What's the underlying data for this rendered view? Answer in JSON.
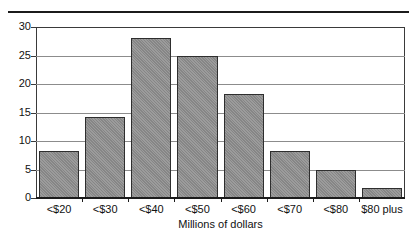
{
  "chart_data": {
    "type": "bar",
    "title": "",
    "subtitle": "",
    "xlabel": "Millions of dollars",
    "ylabel": "",
    "categories": [
      "<$20",
      "<$30",
      "<$40",
      "<$50",
      "<$60",
      "<$70",
      "<$80",
      "$80 plus"
    ],
    "values": [
      8.3,
      14.2,
      28.0,
      25.0,
      18.3,
      8.3,
      5.0,
      1.7
    ],
    "ylim": [
      0,
      30
    ],
    "yticks": [
      0,
      5,
      10,
      15,
      20,
      25,
      30
    ],
    "ytick_labels": [
      "0",
      "5",
      "10",
      "15",
      "20",
      "25",
      "30"
    ],
    "grid": true,
    "grid_axis": "y",
    "legend": false,
    "legend_position": "none",
    "bar_color": "#8d8d8d",
    "bar_edge_color": "#2e2e2e",
    "gridline_color": "#8c8c8c",
    "axis_color": "#1b1b1b",
    "text_color": "#111111",
    "background_color": "#ffffff"
  },
  "figure": {
    "top_rule": "",
    "xaxis_title": "Millions of dollars"
  }
}
